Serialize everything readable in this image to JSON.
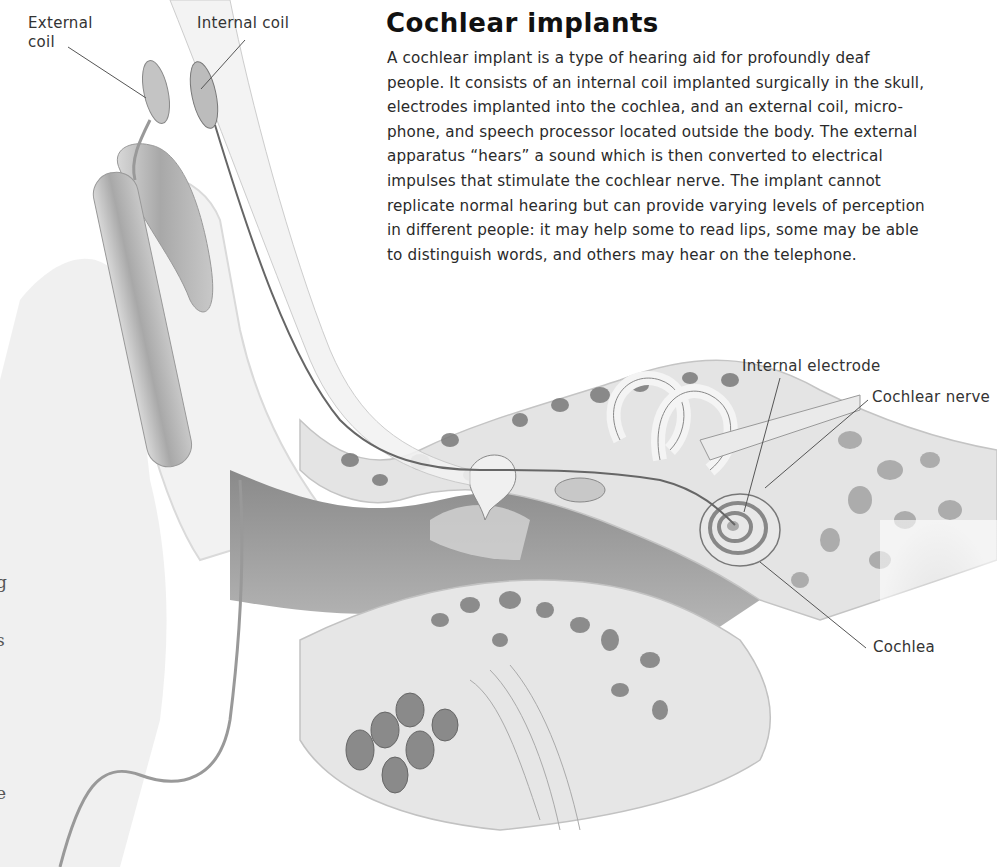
{
  "article": {
    "title": "Cochlear implants",
    "body_lines": [
      "A cochlear implant is a type of hearing aid for profoundly deaf",
      "people. It consists of an internal coil implanted surgically in the skull,",
      "electrodes implanted into the cochlea, and an external coil, micro-",
      "phone, and speech processor located outside the body. The external",
      "apparatus “hears” a sound which is then converted to electrical",
      "impulses that stimulate the cochlear nerve. The implant cannot",
      "replicate normal hearing but can provide varying levels of perception",
      "in different people: it may help some to read lips, some may be able",
      "to distinguish words, and others may hear on the telephone."
    ]
  },
  "labels": {
    "external_coil": [
      "External",
      "coil"
    ],
    "internal_coil": "Internal coil",
    "internal_electrode": "Internal electrode",
    "cochlear_nerve": "Cochlear nerve",
    "cochlea": "Cochlea"
  },
  "edge_fragments": [
    "g",
    "s",
    "e"
  ],
  "colors": {
    "background": "#ffffff",
    "text": "#2a2a2a",
    "bone": "#e4e4e4",
    "bone_cavity": "#7a7a7a",
    "canal": "#9a9a9a",
    "leader_line": "#555555"
  }
}
